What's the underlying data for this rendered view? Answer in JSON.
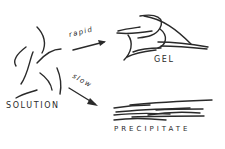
{
  "diagram": {
    "type": "process-flow",
    "nodes": [
      {
        "id": "solution",
        "label": "SOLUTION",
        "description": "Dispersed, separate polymer chains"
      },
      {
        "id": "gel",
        "label": "GEL",
        "description": "Partially aligned chains forming junction zones in a network"
      },
      {
        "id": "precipitate",
        "label": "PRECIPITATE",
        "description": "Extensively aligned, aggregated parallel chains"
      }
    ],
    "edges": [
      {
        "from": "solution",
        "to": "gel",
        "label": "rapid"
      },
      {
        "from": "solution",
        "to": "precipitate",
        "label": "slow"
      }
    ]
  },
  "labels": {
    "solution": "SOLUTION",
    "gel": "GEL",
    "precipitate": "PRECIPITATE",
    "rapid": "rapid",
    "slow": "slow"
  },
  "colors": {
    "ink": "#2a2a2a",
    "background": "#ffffff"
  }
}
